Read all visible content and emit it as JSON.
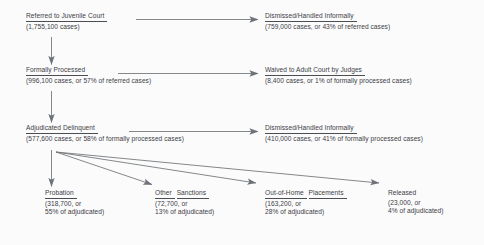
{
  "diagram": {
    "text_color": "#3c4044",
    "arrow_color": "#6e7276",
    "background_color": "#fbfbfc",
    "nodes": [
      {
        "id": "referred",
        "heading": "Referred to Juvenile Court",
        "underlined": true,
        "lines": [
          "(1,755,100 cases)"
        ]
      },
      {
        "id": "dismissed-1",
        "heading": "Dismissed/Handled Informally",
        "underlined": true,
        "lines": [
          "(759,000 cases, or 43% of referred cases)"
        ]
      },
      {
        "id": "formally-processed",
        "heading": "Formally Processed",
        "underlined": true,
        "lines": [
          "(996,100 cases, or 57% of referred cases)"
        ]
      },
      {
        "id": "waived",
        "heading": "Waived to Adult Court by Judges",
        "underlined": true,
        "lines": [
          "(8,400 cases, or 1% of formally processed cases)"
        ]
      },
      {
        "id": "adjudicated",
        "heading": "Adjudicated Delinquent",
        "underlined": true,
        "lines": [
          "(577,600 cases, or 58% of formally processed cases)"
        ]
      },
      {
        "id": "dismissed-2",
        "heading": "Dismissed/Handled Informally",
        "underlined": true,
        "lines": [
          "(410,000 cases, or 41% of formally processed cases)"
        ]
      },
      {
        "id": "probation",
        "heading": "Probation",
        "underlined": true,
        "lines": [
          "(318,700, or",
          "55% of adjudicated)"
        ]
      },
      {
        "id": "other-sanctions",
        "heading": "Other",
        "heading2": "Sanctions",
        "underlined": true,
        "lines": [
          "(72,700, or",
          "13% of adjudicated)"
        ]
      },
      {
        "id": "out-of-home",
        "heading": "Out-of-Home",
        "heading2": "Placements",
        "underlined": true,
        "lines": [
          "(163,200, or",
          "28% of adjudicated)"
        ]
      },
      {
        "id": "released",
        "heading": "Released",
        "underlined": false,
        "lines": [
          "(23,000, or",
          "4% of adjudicated)"
        ]
      }
    ]
  }
}
